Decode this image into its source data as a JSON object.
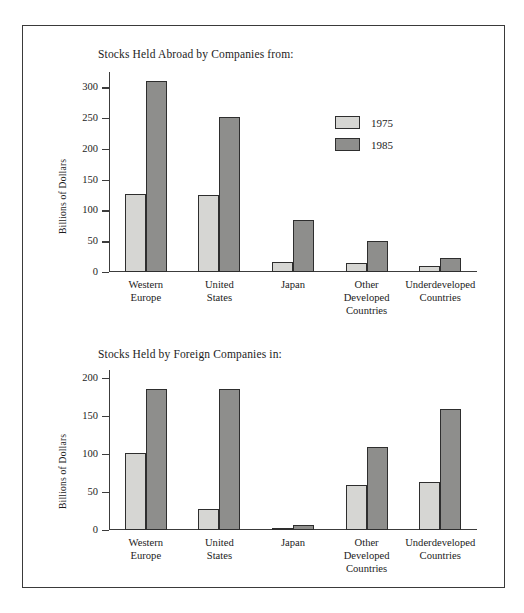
{
  "figure": {
    "ylabel": "Billions of Dollars",
    "legend": [
      {
        "key": "y1975",
        "label": "1975",
        "color": "#d6d6d3"
      },
      {
        "key": "y1985",
        "label": "1985",
        "color": "#8e8e8c"
      }
    ]
  },
  "chart_data": [
    {
      "type": "bar",
      "title": "Stocks Held Abroad by Companies from:",
      "xlabel": "",
      "ylabel": "Billions of Dollars",
      "ylim": [
        0,
        325
      ],
      "yticks": [
        0,
        50,
        100,
        150,
        200,
        250,
        300
      ],
      "ytick_labels": [
        "0",
        "50",
        "100",
        "150",
        "200",
        "250",
        "300"
      ],
      "grid": false,
      "legend_position": "upper right",
      "categories": [
        "Western\nEurope",
        "United\nStates",
        "Japan",
        "Other\nDeveloped\nCountries",
        "Underdeveloped\nCountries"
      ],
      "category_lines": [
        [
          "Western",
          "Europe"
        ],
        [
          "United",
          "States"
        ],
        [
          "Japan"
        ],
        [
          "Other",
          "Developed",
          "Countries"
        ],
        [
          "Underdeveloped",
          "Countries"
        ]
      ],
      "series": [
        {
          "name": "1975",
          "values": [
            126,
            125,
            17,
            15,
            9
          ]
        },
        {
          "name": "1985",
          "values": [
            310,
            252,
            84,
            51,
            22
          ]
        }
      ]
    },
    {
      "type": "bar",
      "title": "Stocks Held by Foreign Companies in:",
      "xlabel": "",
      "ylabel": "Billions of Dollars",
      "ylim": [
        0,
        210
      ],
      "yticks": [
        0,
        50,
        100,
        150,
        200
      ],
      "ytick_labels": [
        "0",
        "50",
        "100",
        "150",
        "200"
      ],
      "grid": false,
      "legend_position": "none",
      "categories": [
        "Western\nEurope",
        "United\nStates",
        "Japan",
        "Other\nDeveloped\nCountries",
        "Underdeveloped\nCountries"
      ],
      "category_lines": [
        [
          "Western",
          "Europe"
        ],
        [
          "United",
          "States"
        ],
        [
          "Japan"
        ],
        [
          "Other",
          "Developed",
          "Countries"
        ],
        [
          "Underdeveloped",
          "Countries"
        ]
      ],
      "series": [
        {
          "name": "1975",
          "values": [
            101,
            28,
            1,
            59,
            63
          ]
        },
        {
          "name": "1985",
          "values": [
            185,
            185,
            6,
            109,
            159
          ]
        }
      ]
    }
  ]
}
